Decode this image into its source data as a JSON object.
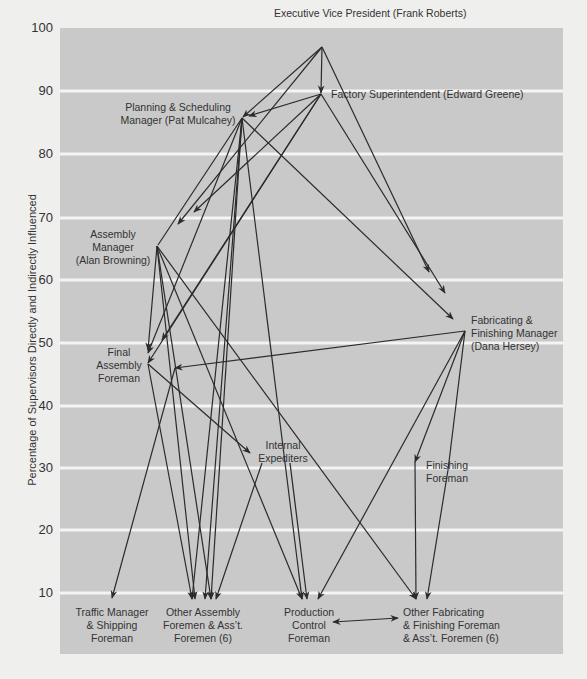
{
  "chart": {
    "y_axis_title": "Percentage of Supervisors Directly and Indirectly Influenced",
    "y_ticks": [
      {
        "label": "100",
        "y": 28
      },
      {
        "label": "90",
        "y": 91
      },
      {
        "label": "80",
        "y": 154
      },
      {
        "label": "70",
        "y": 218
      },
      {
        "label": "60",
        "y": 280
      },
      {
        "label": "50",
        "y": 343
      },
      {
        "label": "40",
        "y": 406
      },
      {
        "label": "30",
        "y": 468
      },
      {
        "label": "20",
        "y": 530
      },
      {
        "label": "10",
        "y": 593
      }
    ],
    "plot_area": {
      "x": 60,
      "y": 28,
      "width": 503,
      "height": 626
    },
    "colors": {
      "plot_bg": "#c9c9c9",
      "gridline": "#f4f4f4",
      "line": "#2b2b2b",
      "page_bg": "#efefed"
    }
  },
  "nodes": [
    {
      "id": "evp",
      "x": 322,
      "y": 47,
      "value": 97,
      "anchor": "start",
      "label_x": 274,
      "label_y": 17,
      "lines": [
        "Executive Vice President (Frank Roberts)"
      ]
    },
    {
      "id": "factory",
      "x": 321,
      "y": 94,
      "value": 90,
      "anchor": "start",
      "label_x": 331,
      "label_y": 98,
      "lines": [
        "Factory Superintendent (Edward Greene)"
      ]
    },
    {
      "id": "planning",
      "x": 242,
      "y": 118,
      "value": 86,
      "anchor": "middle",
      "label_x": 178,
      "label_y": 111,
      "lines": [
        "Planning & Scheduling",
        "Manager (Pat Mulcahey)"
      ]
    },
    {
      "id": "assembly_mgr",
      "x": 157,
      "y": 246,
      "value": 65,
      "anchor": "middle",
      "label_x": 113,
      "label_y": 238,
      "lines": [
        "Assembly",
        "Manager",
        "(Alan Browning)"
      ]
    },
    {
      "id": "fab_fin_mgr",
      "x": 465,
      "y": 331,
      "value": 52,
      "anchor": "start",
      "label_x": 471,
      "label_y": 324,
      "lines": [
        "Fabricating &",
        "Finishing Manager",
        "(Dana Hersey)"
      ]
    },
    {
      "id": "final_assembly",
      "x": 148,
      "y": 364,
      "value": 46,
      "anchor": "middle",
      "label_x": 119,
      "label_y": 356,
      "lines": [
        "Final",
        "Assembly",
        "Foreman"
      ]
    },
    {
      "id": "internal_exp",
      "x": 250,
      "y": 453,
      "value": 32,
      "anchor": "middle",
      "label_x": 283,
      "label_y": 449,
      "lines": [
        "Internal",
        "Expediters"
      ]
    },
    {
      "id": "finishing",
      "x": 415,
      "y": 458,
      "value": 31,
      "anchor": "start",
      "label_x": 426,
      "label_y": 469,
      "lines": [
        "Finishing",
        "Foreman"
      ]
    },
    {
      "id": "traffic",
      "x": 112,
      "y": 598,
      "value": 9,
      "anchor": "middle",
      "label_x": 112,
      "label_y": 616,
      "lines": [
        "Traffic Manager",
        "& Shipping",
        "Foreman"
      ]
    },
    {
      "id": "other_assembly",
      "x": 205,
      "y": 600,
      "value": 9,
      "anchor": "middle",
      "label_x": 203,
      "label_y": 616,
      "lines": [
        "Other Assembly",
        "Foremen & Ass’t.",
        "Foremen (6)"
      ]
    },
    {
      "id": "production_control",
      "x": 307,
      "y": 600,
      "value": 9,
      "anchor": "middle",
      "label_x": 309,
      "label_y": 616,
      "lines": [
        "Production",
        "Control",
        "Foreman"
      ]
    },
    {
      "id": "other_fab",
      "x": 420,
      "y": 600,
      "value": 9,
      "anchor": "start",
      "label_x": 403,
      "label_y": 616,
      "lines": [
        "Other Fabricating",
        "& Finishing Foreman",
        "& Ass’t. Foremen (6)"
      ]
    }
  ],
  "edges": [
    {
      "from": [
        322,
        47
      ],
      "to": [
        321,
        93
      ],
      "arrow": true
    },
    {
      "from": [
        322,
        47
      ],
      "to": [
        243,
        117
      ],
      "arrow": true
    },
    {
      "from": [
        322,
        47
      ],
      "to": [
        429,
        272
      ],
      "arrow": true
    },
    {
      "from": [
        322,
        47
      ],
      "to": [
        178,
        224
      ],
      "arrow": true
    },
    {
      "from": [
        321,
        94
      ],
      "to": [
        249,
        116
      ],
      "arrow": true
    },
    {
      "from": [
        321,
        94
      ],
      "to": [
        194,
        212
      ],
      "arrow": true
    },
    {
      "from": [
        321,
        94
      ],
      "to": [
        148,
        363
      ],
      "arrow": true
    },
    {
      "from": [
        321,
        94
      ],
      "to": [
        162,
        340
      ],
      "arrow": true
    },
    {
      "from": [
        321,
        94
      ],
      "to": [
        445,
        293
      ],
      "arrow": true
    },
    {
      "from": [
        242,
        118
      ],
      "to": [
        158,
        245
      ],
      "arrow": false
    },
    {
      "from": [
        242,
        118
      ],
      "to": [
        148,
        353
      ],
      "arrow": true
    },
    {
      "from": [
        242,
        118
      ],
      "to": [
        453,
        319
      ],
      "arrow": true
    },
    {
      "from": [
        242,
        118
      ],
      "to": [
        192,
        599
      ],
      "arrow": true
    },
    {
      "from": [
        242,
        118
      ],
      "to": [
        205,
        599
      ],
      "arrow": true
    },
    {
      "from": [
        242,
        118
      ],
      "to": [
        302,
        599
      ],
      "arrow": true
    },
    {
      "from": [
        242,
        118
      ],
      "to": [
        211,
        599
      ],
      "arrow": true
    },
    {
      "from": [
        157,
        246
      ],
      "to": [
        148,
        350
      ],
      "arrow": true
    },
    {
      "from": [
        157,
        246
      ],
      "to": [
        211,
        599
      ],
      "arrow": true
    },
    {
      "from": [
        157,
        246
      ],
      "to": [
        302,
        599
      ],
      "arrow": true
    },
    {
      "from": [
        157,
        246
      ],
      "to": [
        416,
        599
      ],
      "arrow": true
    },
    {
      "from": [
        157,
        246
      ],
      "to": [
        195,
        599
      ],
      "arrow": true
    },
    {
      "from": [
        465,
        331
      ],
      "to": [
        175,
        368
      ],
      "arrow": true
    },
    {
      "from": [
        465,
        331
      ],
      "to": [
        318,
        599
      ],
      "arrow": true
    },
    {
      "from": [
        465,
        331
      ],
      "to": [
        415,
        462
      ],
      "arrow": true
    },
    {
      "from": [
        465,
        331
      ],
      "to": [
        448,
        470
      ],
      "arrow": false
    },
    {
      "from": [
        148,
        364
      ],
      "to": [
        250,
        453
      ],
      "arrow": true
    },
    {
      "from": [
        148,
        364
      ],
      "to": [
        192,
        599
      ],
      "arrow": true
    },
    {
      "from": [
        175,
        368
      ],
      "to": [
        112,
        598
      ],
      "arrow": true
    },
    {
      "from": [
        262,
        463
      ],
      "to": [
        216,
        599
      ],
      "arrow": true
    },
    {
      "from": [
        290,
        463
      ],
      "to": [
        307,
        599
      ],
      "arrow": true
    },
    {
      "from": [
        415,
        462
      ],
      "to": [
        416,
        599
      ],
      "arrow": true
    },
    {
      "from": [
        448,
        470
      ],
      "to": [
        427,
        599
      ],
      "arrow": true
    },
    {
      "from": [
        333,
        622
      ],
      "to": [
        398,
        618
      ],
      "arrow": true,
      "both": true
    }
  ]
}
